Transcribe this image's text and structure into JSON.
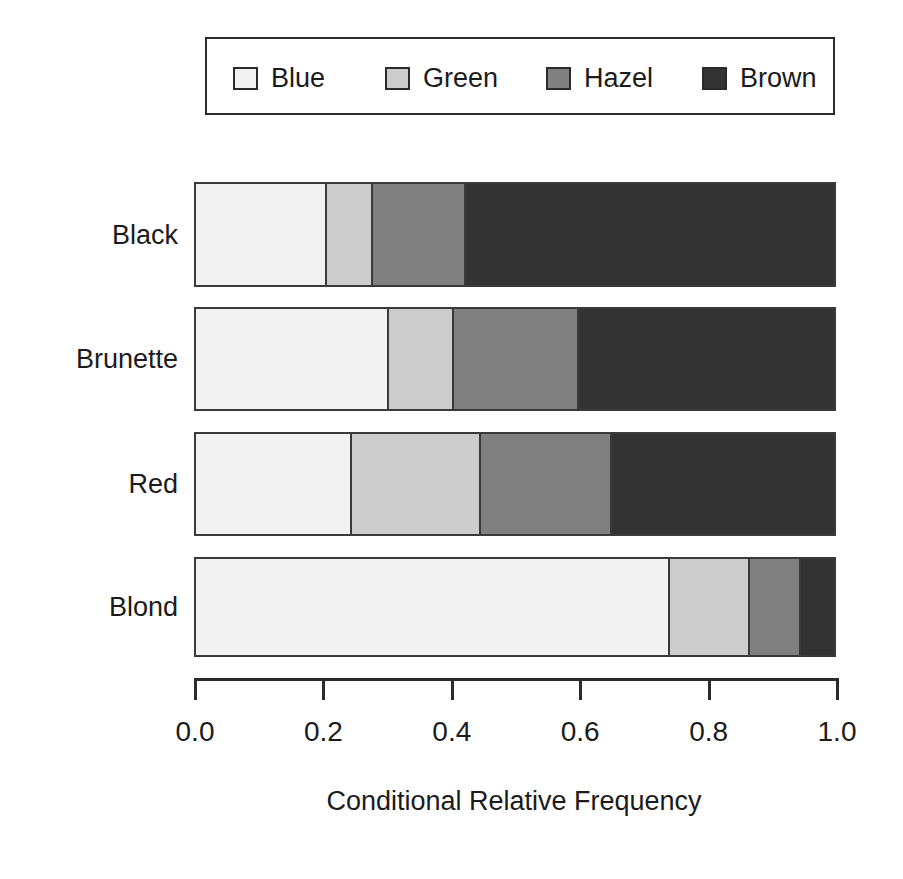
{
  "chart_data": {
    "type": "bar",
    "orientation": "horizontal",
    "stacked": true,
    "normalized": true,
    "title": "",
    "subtitle": "",
    "xlabel": "Conditional Relative Frequency",
    "ylabel": "",
    "xlim": [
      0.0,
      1.0
    ],
    "xticks": [
      "0.0",
      "0.2",
      "0.4",
      "0.6",
      "0.8",
      "1.0"
    ],
    "xtick_values": [
      0.0,
      0.2,
      0.4,
      0.6,
      0.8,
      1.0
    ],
    "grid": false,
    "legend_position": "top",
    "categories": [
      "Black",
      "Brunette",
      "Red",
      "Blond"
    ],
    "series": [
      {
        "name": "Blue",
        "color": "#f2f2f2",
        "values": [
          0.205,
          0.302,
          0.245,
          0.743
        ]
      },
      {
        "name": "Green",
        "color": "#cccccc",
        "values": [
          0.073,
          0.103,
          0.201,
          0.126
        ]
      },
      {
        "name": "Hazel",
        "color": "#808080",
        "values": [
          0.145,
          0.196,
          0.206,
          0.079
        ]
      },
      {
        "name": "Brown",
        "color": "#333333",
        "values": [
          0.577,
          0.399,
          0.348,
          0.052
        ]
      }
    ]
  },
  "legend": {
    "entries": [
      {
        "label": "Blue",
        "color": "#f2f2f2"
      },
      {
        "label": "Green",
        "color": "#cccccc"
      },
      {
        "label": "Hazel",
        "color": "#808080"
      },
      {
        "label": "Brown",
        "color": "#333333"
      }
    ]
  },
  "axis": {
    "title": "Conditional Relative Frequency",
    "tick_labels": [
      "0.0",
      "0.2",
      "0.4",
      "0.6",
      "0.8",
      "1.0"
    ]
  },
  "rows": [
    {
      "label": "Black"
    },
    {
      "label": "Brunette"
    },
    {
      "label": "Red"
    },
    {
      "label": "Blond"
    }
  ],
  "colors": {
    "outline": "#3a3a3a",
    "axis": "#2b2b2b",
    "text": "#1b1b1b",
    "background": "#ffffff"
  }
}
